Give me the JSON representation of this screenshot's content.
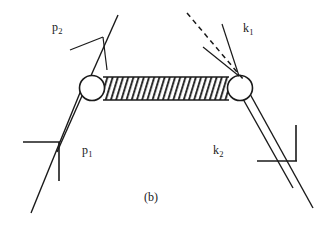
{
  "figure": {
    "caption": "(b)",
    "background_color": "#ffffff",
    "stroke_color": "#1a1a1a",
    "labels": [
      {
        "id": "p2",
        "base": "p",
        "sub": "2",
        "x": 52,
        "y": 22,
        "description": "incoming-momentum-p2"
      },
      {
        "id": "k1",
        "base": "k",
        "sub": "1",
        "x": 243,
        "y": 23,
        "description": "incoming-momentum-k1"
      },
      {
        "id": "p1",
        "base": "p",
        "sub": "1",
        "x": 82,
        "y": 145,
        "description": "outgoing-momentum-p1"
      },
      {
        "id": "k2",
        "base": "k",
        "sub": "2",
        "x": 213,
        "y": 145,
        "description": "outgoing-momentum-k2"
      }
    ],
    "blob": {
      "left_circle": {
        "cx": 92,
        "cy": 88,
        "r": 12.5
      },
      "right_circle": {
        "cx": 240,
        "cy": 88,
        "r": 12.5
      },
      "hatch_rect": {
        "x": 104,
        "y": 77,
        "w": 124,
        "h": 23
      },
      "hatch_count": 26,
      "hatch_slant": 7
    },
    "lines": {
      "left_upper_main": {
        "x1": 57,
        "y1": 152,
        "x2": 118,
        "y2": 15
      },
      "left_lower_main": {
        "x1": 31,
        "y1": 213,
        "x2": 86,
        "y2": 78
      },
      "right_upper_main": {
        "x1": 249,
        "y1": 94,
        "x2": 313,
        "y2": 208
      },
      "right_lower_main": {
        "x1": 244,
        "y1": 99,
        "x2": 293,
        "y2": 186
      },
      "dashed_photon": {
        "x1": 188,
        "y1": 14,
        "x2": 241,
        "y2": 76,
        "dash": "5,4"
      },
      "arrow_p2_tip": {
        "x": 103,
        "y": 37
      },
      "arrow_p2_barb_a": {
        "x": 70,
        "y": 50
      },
      "arrow_p2_barb_b": {
        "x": 108,
        "y": 68
      },
      "arrow_k1_tip": {
        "x": 240,
        "y": 76
      },
      "arrow_k1_barb_a": {
        "x": 205,
        "y": 48
      },
      "arrow_k1_barb_b": {
        "x": 222,
        "y": 25
      }
    },
    "tick_marks": {
      "left": {
        "h_x1": 23,
        "h_x2": 60,
        "h_y": 142,
        "v_x": 59,
        "v_y1": 142,
        "v_y2": 181
      },
      "right": {
        "v_x": 296,
        "v_y1": 125,
        "v_y2": 161,
        "h_x1": 257,
        "h_x2": 296,
        "h_y": 161
      }
    }
  }
}
